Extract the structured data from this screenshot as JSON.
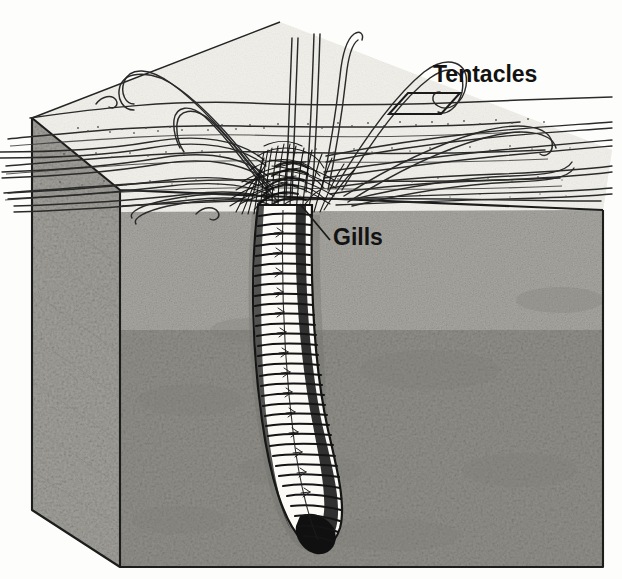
{
  "figure": {
    "background_color": "#fdfdfb",
    "ink_color": "#1a1a1a",
    "medium": "halftone line engraving"
  },
  "labels": [
    {
      "id": "tentacles",
      "text": "Tentacles",
      "x": 433,
      "y": 82,
      "font_size": 23,
      "leader": "bracket-parallelogram",
      "points_to": "surface-tentacle-strands"
    },
    {
      "id": "gills",
      "text": "Gills",
      "x": 333,
      "y": 245,
      "font_size": 23,
      "leader": "straight-line",
      "points_to": "gill-tuft"
    }
  ],
  "sediment_block": {
    "name": "sediment-block",
    "top_face_color": "#f4f3ef",
    "left_face_color": "#9a9a96",
    "front_face_upper_color": "#b4b3ae",
    "front_face_lower_color": "#8d8c87",
    "edge_color": "#1c1c1c",
    "corners": {
      "top_left": [
        32,
        118
      ],
      "top_mid_left": [
        120,
        190
      ],
      "front_top_left": [
        120,
        212
      ],
      "front_top_right": [
        603,
        210
      ],
      "bottom_right": [
        603,
        567
      ],
      "bottom_left": [
        120,
        567
      ],
      "left_bottom": [
        32,
        510
      ]
    }
  },
  "organism": {
    "name": "lugworm",
    "parts": [
      {
        "id": "tentacle-crown",
        "label": "Tentacles",
        "count_visible": 16,
        "description": "long thin double-line strands radiating across sediment surface and rising vertically with hooked tips"
      },
      {
        "id": "gill-tuft",
        "label": "Gills",
        "description": "dense dark feathery tuft surrounding the anterior trunk at the sediment surface"
      },
      {
        "id": "segmented-trunk",
        "label": "Segmented body",
        "segment_count": 34,
        "description": "vertical annulated trunk descending into burrow, white bands with dark septa, shaded right margin"
      },
      {
        "id": "tail-tip",
        "label": "Tail",
        "description": "trunk curves to the right and terminates in a solid dark rounded tip"
      }
    ]
  },
  "surface_features": {
    "stipple": "scattered dot clusters indicating sand grains",
    "ripples": "several long horizontal contour lines across the top face"
  }
}
